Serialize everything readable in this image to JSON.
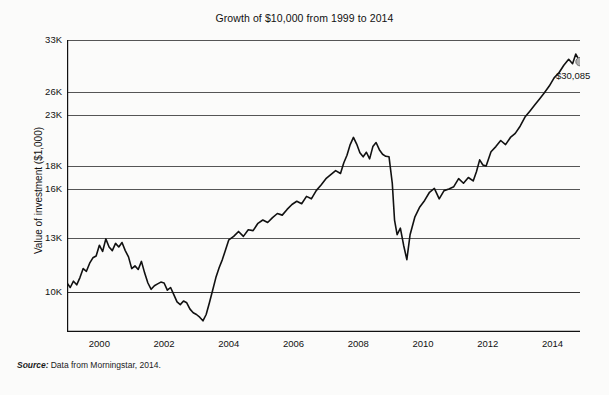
{
  "chart_data": {
    "type": "line",
    "title": "Growth of $10,000 from 1999 to 2014",
    "xlabel": "",
    "ylabel": "Value of investment ($1,000)",
    "xlim": [
      1999.0,
      2014.85
    ],
    "ylim": [
      8000,
      33000
    ],
    "grid": true,
    "legend": null,
    "xticks": [
      2000,
      2002,
      2004,
      2006,
      2008,
      2010,
      2012,
      2014
    ],
    "xtick_labels": [
      "2000",
      "2002",
      "2004",
      "2006",
      "2008",
      "2010",
      "2012",
      "2014"
    ],
    "yticks": [
      10000,
      13000,
      16000,
      18000,
      23000,
      26000,
      33000
    ],
    "ytick_labels": [
      "10K",
      "13K",
      "16K",
      "18K",
      "23K",
      "26K",
      "33K"
    ],
    "annotations": [
      {
        "name": "endpoint-value",
        "text": "$30,085",
        "x": 2014.85,
        "y": 30085,
        "marker": "circle",
        "marker_color": "#b0b0b0"
      }
    ],
    "series": [
      {
        "name": "Value of investment",
        "color": "#111111",
        "x": [
          1999.0,
          1999.1,
          1999.2,
          1999.3,
          1999.4,
          1999.5,
          1999.6,
          1999.7,
          1999.8,
          1999.9,
          2000.0,
          2000.1,
          2000.2,
          2000.3,
          2000.4,
          2000.5,
          2000.6,
          2000.7,
          2000.8,
          2000.9,
          2001.0,
          2001.1,
          2001.2,
          2001.3,
          2001.4,
          2001.5,
          2001.6,
          2001.7,
          2001.8,
          2001.9,
          2002.0,
          2002.1,
          2002.2,
          2002.3,
          2002.4,
          2002.5,
          2002.6,
          2002.7,
          2002.8,
          2002.9,
          2003.0,
          2003.1,
          2003.2,
          2003.3,
          2003.4,
          2003.5,
          2003.6,
          2003.7,
          2003.8,
          2003.9,
          2004.0,
          2004.15,
          2004.3,
          2004.45,
          2004.6,
          2004.75,
          2004.9,
          2005.05,
          2005.2,
          2005.35,
          2005.5,
          2005.65,
          2005.8,
          2005.95,
          2006.1,
          2006.25,
          2006.4,
          2006.55,
          2006.7,
          2006.85,
          2007.0,
          2007.15,
          2007.3,
          2007.45,
          2007.55,
          2007.65,
          2007.75,
          2007.85,
          2007.95,
          2008.05,
          2008.15,
          2008.25,
          2008.35,
          2008.45,
          2008.55,
          2008.65,
          2008.75,
          2008.85,
          2008.95,
          2009.05,
          2009.12,
          2009.2,
          2009.3,
          2009.4,
          2009.5,
          2009.6,
          2009.75,
          2009.9,
          2010.05,
          2010.2,
          2010.35,
          2010.5,
          2010.65,
          2010.8,
          2010.95,
          2011.1,
          2011.25,
          2011.4,
          2011.55,
          2011.65,
          2011.75,
          2011.85,
          2011.95,
          2012.1,
          2012.25,
          2012.4,
          2012.55,
          2012.7,
          2012.85,
          2013.0,
          2013.15,
          2013.3,
          2013.45,
          2013.6,
          2013.75,
          2013.9,
          2014.05,
          2014.2,
          2014.35,
          2014.5,
          2014.62,
          2014.72,
          2014.85
        ],
        "y": [
          10500,
          10250,
          10600,
          10400,
          10800,
          11300,
          11150,
          11600,
          11900,
          12000,
          12600,
          12250,
          12950,
          12500,
          12300,
          12700,
          12500,
          12750,
          12300,
          11950,
          11300,
          11450,
          11250,
          11700,
          11050,
          10500,
          10150,
          10350,
          10450,
          10550,
          10500,
          10100,
          10250,
          9850,
          9450,
          9300,
          9500,
          9400,
          9050,
          8850,
          8750,
          8600,
          8400,
          8750,
          9400,
          10100,
          10800,
          11350,
          11800,
          12350,
          12900,
          13100,
          13400,
          13100,
          13500,
          13450,
          13900,
          14100,
          13950,
          14250,
          14500,
          14400,
          14750,
          15050,
          15250,
          15100,
          15550,
          15400,
          15900,
          16350,
          16900,
          17250,
          17600,
          17350,
          18300,
          19050,
          20100,
          20800,
          20150,
          19300,
          18900,
          19350,
          18700,
          19900,
          20300,
          19600,
          19150,
          18950,
          18900,
          16500,
          14100,
          13200,
          13600,
          12600,
          11800,
          13200,
          14300,
          14900,
          15300,
          15800,
          16050,
          15400,
          15900,
          16000,
          16200,
          16900,
          16500,
          17000,
          16700,
          17500,
          18600,
          18100,
          18000,
          19400,
          19900,
          20500,
          20100,
          20800,
          21200,
          21900,
          22800,
          23500,
          24300,
          25100,
          25900,
          26800,
          27900,
          28600,
          29600,
          30400,
          29800,
          31100,
          30085
        ]
      }
    ]
  },
  "footnote": {
    "label": "Source:",
    "text": "Data from Morningstar, 2014."
  }
}
